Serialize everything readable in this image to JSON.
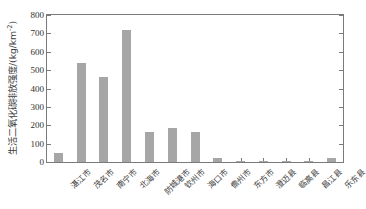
{
  "chart_data": {
    "type": "bar",
    "title": "",
    "xlabel": "",
    "ylabel": "生活二氧化碳排放强度/(kg/km",
    "ylabel_superscript": "-2",
    "ylabel_full": "生活二氧化碳排放强度/(kg/km-2)",
    "categories": [
      "湛江市",
      "茂名市",
      "南宁市",
      "北海市",
      "防城港市",
      "钦州市",
      "海口市",
      "儋州市",
      "东方市",
      "澄迈县",
      "临高县",
      "昌江县",
      "乐东县"
    ],
    "values": [
      48,
      540,
      460,
      718,
      162,
      186,
      162,
      20,
      2,
      6,
      2,
      2,
      22
    ],
    "ylim": [
      0,
      800
    ],
    "yticks": [
      0,
      100,
      200,
      300,
      400,
      500,
      600,
      700,
      800
    ],
    "ytick_labels": [
      "0",
      "100",
      "200",
      "300",
      "400",
      "500",
      "600",
      "700",
      "800"
    ],
    "grid": false,
    "legend": null,
    "bar_color": "#a6a6a6",
    "axis_color": "#7a7a7a",
    "text_color": "#3b3b3b"
  }
}
